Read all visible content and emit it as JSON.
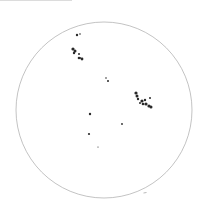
{
  "drawing": {
    "type": "solar-disk-sunspot-drawing",
    "background": "#ffffff",
    "disk": {
      "cx": 104,
      "cy": 110,
      "r": 88,
      "stroke": "#9a9a9a"
    },
    "ink": "#2a2a2a",
    "groups": [
      {
        "name": "group-upper-left-small",
        "spots": [
          [
            77,
            35,
            1.2
          ],
          [
            80,
            34,
            0.8
          ]
        ]
      },
      {
        "name": "group-upper-left",
        "spots": [
          [
            73,
            49,
            1.6
          ],
          [
            75,
            51,
            1.5
          ],
          [
            74,
            53,
            1.2
          ],
          [
            79,
            54,
            1.0
          ],
          [
            79,
            58,
            1.3
          ],
          [
            82,
            59,
            1.4
          ],
          [
            80,
            58,
            1.0
          ]
        ]
      },
      {
        "name": "group-center",
        "spots": [
          [
            106,
            78,
            0.8
          ],
          [
            108,
            81,
            1.0
          ]
        ]
      },
      {
        "name": "group-right",
        "spots": [
          [
            136,
            93,
            1.6
          ],
          [
            137,
            96,
            1.5
          ],
          [
            138,
            99,
            1.2
          ],
          [
            142,
            101,
            1.6
          ],
          [
            145,
            100,
            1.2
          ],
          [
            146,
            104,
            1.6
          ],
          [
            149,
            106,
            1.6
          ],
          [
            151,
            107,
            1.5
          ],
          [
            143,
            104,
            1.3
          ],
          [
            150,
            98,
            1.0
          ],
          [
            140,
            103,
            1.0
          ]
        ]
      },
      {
        "name": "single-spots",
        "spots": [
          [
            90,
            114,
            1.2
          ],
          [
            122,
            124,
            0.9
          ],
          [
            89,
            134,
            1.1
          ],
          [
            98,
            147,
            0.6
          ]
        ]
      }
    ],
    "marks": [
      {
        "x": 145,
        "y": 193
      }
    ]
  }
}
